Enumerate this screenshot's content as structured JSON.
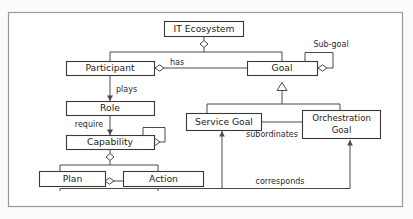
{
  "figure": {
    "kind": "uml-class-diagram",
    "background_color": "#fbfbfa",
    "frame_color": "#9a9a9a",
    "line_color": "#4a4a4a",
    "box_fill": "#ffffff",
    "text_color": "#1c1c1c"
  },
  "nodes": {
    "it_ecosystem": {
      "label": "IT Ecosystem"
    },
    "participant": {
      "label": "Participant"
    },
    "goal": {
      "label": "Goal"
    },
    "role": {
      "label": "Role"
    },
    "capability": {
      "label": "Capability"
    },
    "service_goal": {
      "label": "Service Goal"
    },
    "orchestration_goal_line1": {
      "label": "Orchestration"
    },
    "orchestration_goal_line2": {
      "label": "Goal"
    },
    "plan": {
      "label": "Plan"
    },
    "action": {
      "label": "Action"
    }
  },
  "edge_labels": {
    "has": "has",
    "sub_goal": "Sub-goal",
    "plays": "plays",
    "require": "require",
    "subordinates": "subordinates",
    "corresponds": "corresponds"
  },
  "relationships": [
    {
      "from": "IT Ecosystem",
      "to": "Participant",
      "type": "aggregation",
      "label": ""
    },
    {
      "from": "IT Ecosystem",
      "to": "Goal",
      "type": "aggregation",
      "label": ""
    },
    {
      "from": "Participant",
      "to": "Goal",
      "type": "aggregation",
      "label": "has"
    },
    {
      "from": "Goal",
      "to": "Goal",
      "type": "aggregation",
      "label": "Sub-goal"
    },
    {
      "from": "Participant",
      "to": "Role",
      "type": "directed-association",
      "label": "plays"
    },
    {
      "from": "Role",
      "to": "Capability",
      "type": "directed-association",
      "label": "require"
    },
    {
      "from": "Capability",
      "to": "Capability",
      "type": "aggregation",
      "label": ""
    },
    {
      "from": "Capability",
      "to": "Plan",
      "type": "aggregation",
      "label": ""
    },
    {
      "from": "Capability",
      "to": "Action",
      "type": "aggregation",
      "label": ""
    },
    {
      "from": "Plan",
      "to": "Action",
      "type": "aggregation",
      "label": ""
    },
    {
      "from": "Service Goal",
      "to": "Goal",
      "type": "generalization",
      "label": ""
    },
    {
      "from": "Orchestration Goal",
      "to": "Goal",
      "type": "generalization",
      "label": ""
    },
    {
      "from": "Orchestration Goal",
      "to": "Service Goal",
      "type": "directed-association",
      "label": "subordinates"
    },
    {
      "from": "Plan/Action",
      "to": "Service Goal",
      "type": "directed-association",
      "label": "corresponds"
    },
    {
      "from": "Plan/Action",
      "to": "Orchestration Goal",
      "type": "directed-association",
      "label": "corresponds"
    }
  ]
}
